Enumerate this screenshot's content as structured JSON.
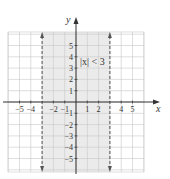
{
  "chart_data": {
    "type": "region",
    "title": "",
    "xlabel": "x",
    "ylabel": "y",
    "xlim": [
      -6,
      6
    ],
    "ylim": [
      -6,
      6
    ],
    "grid": true,
    "x_ticks": [
      -5,
      -4,
      -2,
      -1,
      1,
      2,
      4,
      5
    ],
    "y_ticks": [
      5,
      4,
      3,
      2,
      1,
      -1,
      -2,
      -3,
      -4,
      -5
    ],
    "shaded_region": {
      "x_min": -3,
      "x_max": 3,
      "description": "vertical strip between dashed lines"
    },
    "boundary_lines": [
      {
        "x": -3,
        "style": "dashed",
        "arrows": "both"
      },
      {
        "x": 3,
        "style": "dashed",
        "arrows": "both"
      }
    ],
    "annotation": {
      "text": "|x| < 3",
      "x": 0.2,
      "y": 3.6
    }
  },
  "colors": {
    "shade": "#ebebeb",
    "grid": "#c8c8c8",
    "axis": "#333333",
    "boundary": "#555555"
  },
  "labels": {
    "x_axis": "x",
    "y_axis": "y",
    "inequality": "|x| < 3"
  }
}
